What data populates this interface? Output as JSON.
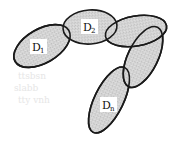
{
  "diagram": {
    "type": "overlapping-ellipse-chain",
    "colors": {
      "fill": "#d4d4d4",
      "stroke": "#1a1a1a",
      "background": "#ffffff"
    },
    "nodes": [
      {
        "id": "D1",
        "base": "D",
        "sub": "1",
        "labeled": true
      },
      {
        "id": "D2",
        "base": "D",
        "sub": "2",
        "labeled": true
      },
      {
        "id": "D3",
        "labeled": false
      },
      {
        "id": "D4",
        "labeled": false
      },
      {
        "id": "Dn",
        "base": "D",
        "sub": "n",
        "labeled": true
      }
    ],
    "ghost_text": [
      "ttsbsn",
      "slabb",
      "tty vnh"
    ]
  }
}
